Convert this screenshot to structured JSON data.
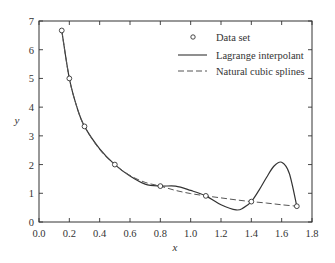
{
  "chart_data": {
    "type": "line",
    "title": "",
    "xlabel": "x",
    "ylabel": "y",
    "xlim": [
      0.0,
      1.8
    ],
    "ylim": [
      0,
      7
    ],
    "xticks": [
      "0.0",
      "0.2",
      "0.4",
      "0.6",
      "0.8",
      "1.0",
      "1.2",
      "1.4",
      "1.6",
      "1.8"
    ],
    "yticks": [
      "0",
      "1",
      "2",
      "3",
      "4",
      "5",
      "6",
      "7"
    ],
    "grid": false,
    "legend_position": "upper right (inside)",
    "legend": [
      {
        "label": "Data set",
        "style": "circle-marker"
      },
      {
        "label": "Lagrange interpolant",
        "style": "solid"
      },
      {
        "label": "Natural cubic splines",
        "style": "dashed"
      }
    ],
    "series": [
      {
        "name": "Data set",
        "style": "markers",
        "x": [
          0.15,
          0.2,
          0.3,
          0.5,
          0.8,
          1.1,
          1.4,
          1.7
        ],
        "y": [
          6.67,
          5.0,
          3.33,
          2.0,
          1.25,
          0.91,
          0.71,
          0.55
        ]
      },
      {
        "name": "Lagrange interpolant",
        "style": "solid",
        "x": [
          0.15,
          0.2,
          0.25,
          0.3,
          0.4,
          0.5,
          0.6,
          0.7,
          0.8,
          0.9,
          1.0,
          1.1,
          1.2,
          1.3,
          1.35,
          1.4,
          1.45,
          1.5,
          1.55,
          1.6,
          1.65,
          1.7
        ],
        "y": [
          6.67,
          5.0,
          4.0,
          3.33,
          2.55,
          2.0,
          1.6,
          1.32,
          1.25,
          1.25,
          1.1,
          0.91,
          0.6,
          0.42,
          0.5,
          0.71,
          1.1,
          1.55,
          1.95,
          2.08,
          1.7,
          0.55
        ]
      },
      {
        "name": "Natural cubic splines",
        "style": "dashed",
        "x": [
          0.15,
          0.2,
          0.25,
          0.3,
          0.4,
          0.5,
          0.6,
          0.7,
          0.8,
          0.9,
          1.0,
          1.1,
          1.2,
          1.3,
          1.4,
          1.5,
          1.6,
          1.7
        ],
        "y": [
          6.67,
          5.0,
          4.0,
          3.33,
          2.52,
          2.0,
          1.62,
          1.38,
          1.25,
          1.1,
          0.99,
          0.91,
          0.84,
          0.77,
          0.71,
          0.66,
          0.6,
          0.55
        ]
      }
    ]
  }
}
